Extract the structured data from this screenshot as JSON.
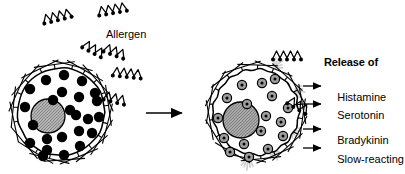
{
  "figure": {
    "title_text": "Allergen",
    "colors": {
      "ink": "#000000",
      "background": "#ffffff",
      "nucleus_fill": "#a8a8a8",
      "granule_released_fill": "#9e9e9e",
      "burst": "#cfcfcf"
    }
  },
  "labels": {
    "allergen": "Allergen",
    "release_of": "Release of"
  },
  "mediators": [
    {
      "name": "Histamine",
      "continuation": ""
    },
    {
      "name": "Serotonin",
      "continuation": ""
    },
    {
      "name": "Bradykinin",
      "continuation": ""
    },
    {
      "name": "Slow-reacting",
      "continuation": "substance"
    }
  ],
  "left_cell": {
    "name": "sensitized-mast-cell",
    "cx": 61,
    "cy": 112,
    "r": 44,
    "nucleus": {
      "cx": 48,
      "cy": 116,
      "r": 17
    },
    "granules": [
      [
        46,
        80
      ],
      [
        64,
        75
      ],
      [
        82,
        81
      ],
      [
        95,
        93
      ],
      [
        30,
        89
      ],
      [
        25,
        107
      ],
      [
        33,
        125
      ],
      [
        30,
        143
      ],
      [
        47,
        150
      ],
      [
        64,
        155
      ],
      [
        80,
        146
      ],
      [
        92,
        133
      ],
      [
        99,
        117
      ],
      [
        97,
        101
      ],
      [
        79,
        97
      ],
      [
        62,
        92
      ],
      [
        76,
        115
      ],
      [
        79,
        131
      ],
      [
        62,
        137
      ],
      [
        47,
        139
      ],
      [
        53,
        100
      ],
      [
        88,
        119
      ],
      [
        43,
        156
      ],
      [
        70,
        110
      ]
    ],
    "granule_r": 5.2
  },
  "right_cell": {
    "name": "degranulating-mast-cell",
    "cx": 256,
    "cy": 112,
    "r": 43,
    "nucleus": {
      "cx": 241,
      "cy": 120,
      "r": 18
    },
    "granules": [
      [
        242,
        85
      ],
      [
        262,
        83
      ],
      [
        227,
        98
      ],
      [
        247,
        104
      ],
      [
        272,
        96
      ],
      [
        288,
        108
      ],
      [
        281,
        122
      ],
      [
        266,
        116
      ],
      [
        261,
        131
      ],
      [
        244,
        144
      ],
      [
        224,
        138
      ],
      [
        230,
        152
      ],
      [
        249,
        157
      ],
      [
        268,
        149
      ],
      [
        283,
        136
      ],
      [
        218,
        118
      ],
      [
        275,
        79
      ]
    ],
    "granule_r": 4.6
  },
  "transition_arrow": {
    "x1": 146,
    "y1": 113,
    "x2": 182,
    "y2": 113
  },
  "mediator_arrows": [
    {
      "x1": 303,
      "y1": 86,
      "x2": 321,
      "y2": 86
    },
    {
      "x1": 303,
      "y1": 104,
      "x2": 321,
      "y2": 104
    },
    {
      "x1": 303,
      "y1": 129,
      "x2": 321,
      "y2": 129
    },
    {
      "x1": 303,
      "y1": 148,
      "x2": 321,
      "y2": 148
    }
  ],
  "free_allergens": [
    {
      "x": 44,
      "y": 22,
      "rot": -14,
      "units": 4
    },
    {
      "x": 99,
      "y": 14,
      "rot": -10,
      "units": 4
    }
  ],
  "bound_allergens": [
    {
      "x": 83,
      "y": 46,
      "rot": 28,
      "units": 3
    },
    {
      "x": 104,
      "y": 50,
      "rot": 20,
      "units": 3
    },
    {
      "x": 113,
      "y": 74,
      "rot": 6,
      "units": 4
    },
    {
      "x": 104,
      "y": 98,
      "rot": 14,
      "units": 3
    },
    {
      "x": 273,
      "y": 58,
      "rot": 0,
      "units": 4
    },
    {
      "x": 288,
      "y": 102,
      "rot": 30,
      "units": 3
    }
  ],
  "receptors": {
    "left_angles_deg": [
      168,
      186,
      204,
      222,
      244,
      262,
      284,
      300,
      318,
      336,
      352,
      14,
      32,
      50,
      68,
      86,
      104,
      122,
      140
    ],
    "right_angles_deg": [
      170,
      190,
      210,
      232,
      252,
      272,
      292,
      312,
      332,
      350,
      8,
      28,
      48,
      66,
      84,
      102,
      120,
      148
    ]
  },
  "bursts": [
    {
      "x": 272,
      "y": 68,
      "rot": -35
    },
    {
      "x": 292,
      "y": 90,
      "rot": 10
    },
    {
      "x": 289,
      "y": 128,
      "rot": 35
    },
    {
      "x": 272,
      "y": 148,
      "rot": 65
    },
    {
      "x": 248,
      "y": 157,
      "rot": 95
    }
  ]
}
